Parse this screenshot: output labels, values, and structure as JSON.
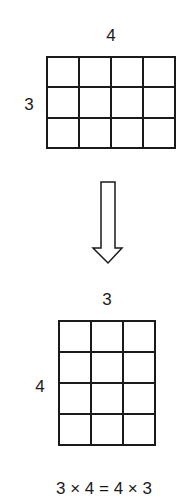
{
  "top_grid": {
    "rows": 3,
    "cols": 4,
    "top_label": "4",
    "left_label": "3"
  },
  "arrow": {
    "direction": "down",
    "style": "outline"
  },
  "bottom_grid": {
    "rows": 4,
    "cols": 3,
    "top_label": "3",
    "left_label": "4"
  },
  "equation": "3 × 4 = 4 × 3",
  "colors": {
    "stroke": "#1a1a1a",
    "background": "#ffffff"
  }
}
